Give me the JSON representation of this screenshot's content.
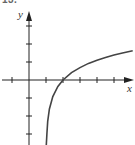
{
  "figure": {
    "header_label": "13."
  },
  "chart_data": {
    "type": "line",
    "title": "",
    "xlabel": "x",
    "ylabel": "y",
    "function_description": "logarithmic curve, vertical asymptote at x=1, crosses x-axis at x=2",
    "x_ticks": [
      -1,
      1,
      2,
      3,
      4,
      5
    ],
    "y_ticks": [
      -3,
      -2,
      -1,
      1,
      2,
      3
    ],
    "xlim": [
      -1.7,
      6.2
    ],
    "ylim": [
      -3.6,
      3.8
    ],
    "grid": false,
    "legend": null,
    "series": [
      {
        "name": "curve",
        "x": [
          1.05,
          1.1,
          1.2,
          1.4,
          1.7,
          2,
          2.5,
          3,
          3.5,
          4,
          4.5,
          5,
          5.5,
          6.1
        ],
        "y": [
          -3.0,
          -2.3,
          -1.61,
          -0.92,
          -0.36,
          0,
          0.41,
          0.69,
          0.92,
          1.1,
          1.25,
          1.39,
          1.5,
          1.63
        ]
      }
    ],
    "colors": {
      "axis": "#222222",
      "curve": "#444444"
    }
  }
}
